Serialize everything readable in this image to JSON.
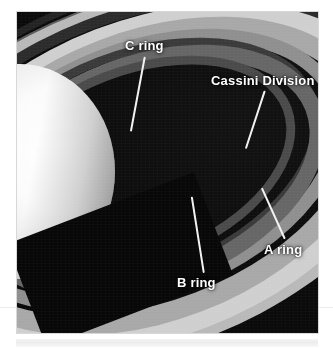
{
  "figure": {
    "kind": "annotated-photograph",
    "background_color": "#ffffff",
    "photo_background_color": "#0a0a0a",
    "label_color": "#ffffff",
    "leader_color": "#f2f2f2"
  },
  "annotations": [
    {
      "id": "c-ring",
      "label": "C ring",
      "label_left": 108,
      "label_top": 26,
      "leader": {
        "x1": 128,
        "y1": 44,
        "x2": 114,
        "y2": 119
      }
    },
    {
      "id": "cassini-division",
      "label": "Cassini Division",
      "label_left": 194,
      "label_top": 61,
      "leader": {
        "x1": 248,
        "y1": 78,
        "x2": 229,
        "y2": 136
      }
    },
    {
      "id": "b-ring",
      "label": "B ring",
      "label_left": 160,
      "label_top": 263,
      "leader": {
        "x1": 175,
        "y1": 184,
        "x2": 187,
        "y2": 260
      }
    },
    {
      "id": "a-ring",
      "label": "A ring",
      "label_left": 247,
      "label_top": 230,
      "leader": {
        "x1": 245,
        "y1": 175,
        "x2": 268,
        "y2": 226
      }
    }
  ],
  "chart_data": {
    "type": "table",
    "categories": [
      "C ring",
      "B ring",
      "Cassini Division",
      "A ring"
    ]
  }
}
